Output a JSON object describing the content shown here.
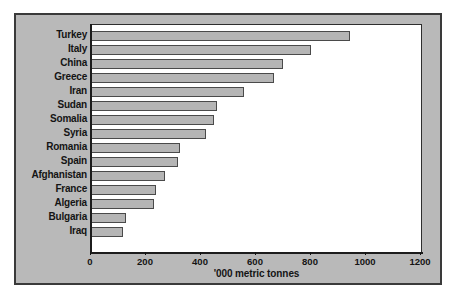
{
  "chart_data": {
    "type": "bar",
    "orientation": "horizontal",
    "title": "",
    "subtitle": "",
    "xlabel": "'000 metric tonnes",
    "ylabel": "",
    "xlim": [
      0,
      1200
    ],
    "xticks": [
      0,
      200,
      400,
      600,
      800,
      1000,
      1200
    ],
    "xtick_labels": [
      "0",
      "200",
      "400",
      "600",
      "800",
      "1000",
      "1200"
    ],
    "grid": false,
    "legend": null,
    "categories": [
      "Turkey",
      "Italy",
      "China",
      "Greece",
      "Iran",
      "Sudan",
      "Somalia",
      "Syria",
      "Romania",
      "Spain",
      "Afghanistan",
      "France",
      "Algeria",
      "Bulgaria",
      "Iraq"
    ],
    "values": [
      945,
      805,
      700,
      668,
      560,
      460,
      450,
      422,
      328,
      320,
      272,
      240,
      233,
      130,
      120
    ],
    "bar_fill_color": "#b5b5b5",
    "bar_edge_color": "#4a4a4a",
    "plot_background": "#ffffff",
    "figure_background": "#b9b9b9",
    "frame_color": "#3a3a3a",
    "text_color": "#141414"
  }
}
